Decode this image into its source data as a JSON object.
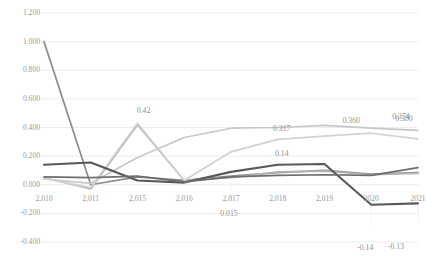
{
  "chart_data": {
    "type": "line",
    "title": "",
    "xlabel": "",
    "ylabel": "",
    "ylim": [
      -0.4,
      1.2
    ],
    "ytick_labels": [
      "1.200",
      "1.000",
      "0.800",
      "0.600",
      "0.400",
      "0.200",
      "0.000",
      "-0.200",
      "-0.400"
    ],
    "ytick_values": [
      1.2,
      1.0,
      0.8,
      0.6,
      0.4,
      0.2,
      0.0,
      -0.2,
      -0.4
    ],
    "grid": "horizontal",
    "legend": "none",
    "categories": [
      "2,010",
      "2,011",
      "2,015",
      "2,016",
      "2,017",
      "2,018",
      "2,019",
      "2020",
      "2021"
    ],
    "x": [
      2010,
      2011,
      2015,
      2016,
      2017,
      2018,
      2019,
      2020,
      2021
    ],
    "series": [
      {
        "name": "series-1",
        "color": "#8d8d8d",
        "values": [
          1.0,
          0.0,
          0.055,
          0.03,
          0.06,
          0.085,
          0.1,
          0.075,
          0.085
        ]
      },
      {
        "name": "series-2",
        "color": "#b5b5b5",
        "values": [
          0.05,
          -0.03,
          0.42,
          0.03,
          0.05,
          0.09,
          0.095,
          0.07,
          0.08
        ]
      },
      {
        "name": "series-3",
        "color": "#c8c8c8",
        "values": [
          0.04,
          0.01,
          0.19,
          0.33,
          0.395,
          0.4,
          0.415,
          0.395,
          0.38
        ]
      },
      {
        "name": "series-4",
        "color": "#d2d2d2",
        "values": [
          0.045,
          -0.02,
          0.43,
          0.03,
          0.23,
          0.317,
          0.34,
          0.36,
          0.32
        ]
      },
      {
        "name": "series-5",
        "color": "#595959",
        "values": [
          0.14,
          0.155,
          0.03,
          0.015,
          0.09,
          0.14,
          0.145,
          -0.14,
          -0.13
        ]
      },
      {
        "name": "series-6",
        "color": "#6e6e6e",
        "values": [
          0.055,
          0.05,
          0.06,
          0.02,
          0.055,
          0.065,
          0.07,
          0.065,
          0.12
        ]
      }
    ],
    "data_labels": [
      {
        "text": "0.42",
        "x": 2015,
        "y": 0.42,
        "anchor": "above"
      },
      {
        "text": "0.317",
        "x": 2018,
        "y": 0.317,
        "anchor": "above"
      },
      {
        "text": "0.360",
        "x": 2020,
        "y": 0.36,
        "anchor": "above"
      },
      {
        "text": "0.374",
        "x": 2021,
        "y": 0.374,
        "anchor": "above"
      },
      {
        "text": "0.380",
        "x": 2021,
        "y": 0.38,
        "anchor": "above-right"
      },
      {
        "text": "0.14",
        "x": 2018,
        "y": 0.14,
        "anchor": "above"
      },
      {
        "text": "0.015",
        "x": 2017,
        "y": 0.015,
        "anchor": "below"
      },
      {
        "text": "-0.14",
        "x": 2020,
        "y": -0.14,
        "anchor": "below"
      },
      {
        "text": "-0.13",
        "x": 2021,
        "y": -0.13,
        "anchor": "below"
      }
    ]
  },
  "labels": {
    "ytick_0": "1.200",
    "ytick_1": "1.000",
    "ytick_2": "0.800",
    "ytick_3": "0.600",
    "ytick_4": "0.400",
    "ytick_5": "0.200",
    "ytick_6": "0.000",
    "ytick_7": "-0.200",
    "ytick_8": "-0.400"
  }
}
